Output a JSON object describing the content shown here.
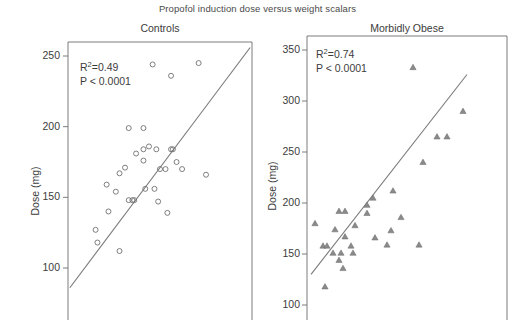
{
  "figure": {
    "title": "Propofol induction dose versus weight scalars",
    "background": "#ffffff",
    "ink_color": "#6e6e6e",
    "text_color": "#3c3c3c"
  },
  "panels": {
    "left": {
      "title": "Controls",
      "r2_prefix": "R",
      "r2_sup": "2",
      "r2_value": "=0.49",
      "pvalue": "P < 0.0001",
      "ylabel": "Dose (mg)",
      "yticks": [
        "100",
        "150",
        "200",
        "250"
      ]
    },
    "right": {
      "title": "Morbidly Obese",
      "r2_prefix": "R",
      "r2_sup": "2",
      "r2_value": "=0.74",
      "pvalue": "P < 0.0001",
      "ylabel": "Dose (mg)",
      "yticks": [
        "100",
        "150",
        "200",
        "250",
        "300",
        "350"
      ]
    }
  },
  "chart_data": [
    {
      "type": "scatter",
      "title": "Controls",
      "xlabel": "",
      "ylabel": "Dose (mg)",
      "ylim": [
        78,
        262
      ],
      "xlim": [
        0,
        1
      ],
      "yticks": [
        100,
        150,
        200,
        250
      ],
      "grid": false,
      "legend": "none",
      "marker": "open-circle",
      "r_squared": 0.49,
      "p_value": "< 0.0001",
      "annotations": [
        "R2 = 0.49",
        "P < 0.0001"
      ],
      "points": [
        {
          "x": 0.46,
          "y": 244
        },
        {
          "x": 0.71,
          "y": 245
        },
        {
          "x": 0.56,
          "y": 236
        },
        {
          "x": 0.33,
          "y": 199
        },
        {
          "x": 0.41,
          "y": 199
        },
        {
          "x": 0.41,
          "y": 184
        },
        {
          "x": 0.48,
          "y": 184
        },
        {
          "x": 0.56,
          "y": 184
        },
        {
          "x": 0.57,
          "y": 184
        },
        {
          "x": 0.41,
          "y": 176
        },
        {
          "x": 0.59,
          "y": 175
        },
        {
          "x": 0.28,
          "y": 167
        },
        {
          "x": 0.75,
          "y": 166
        },
        {
          "x": 0.37,
          "y": 181
        },
        {
          "x": 0.44,
          "y": 186
        },
        {
          "x": 0.31,
          "y": 171
        },
        {
          "x": 0.5,
          "y": 170
        },
        {
          "x": 0.53,
          "y": 170
        },
        {
          "x": 0.62,
          "y": 170
        },
        {
          "x": 0.21,
          "y": 159
        },
        {
          "x": 0.26,
          "y": 154
        },
        {
          "x": 0.42,
          "y": 156
        },
        {
          "x": 0.47,
          "y": 156
        },
        {
          "x": 0.33,
          "y": 148
        },
        {
          "x": 0.35,
          "y": 148
        },
        {
          "x": 0.36,
          "y": 148
        },
        {
          "x": 0.49,
          "y": 147
        },
        {
          "x": 0.54,
          "y": 139
        },
        {
          "x": 0.22,
          "y": 140
        },
        {
          "x": 0.15,
          "y": 127
        },
        {
          "x": 0.16,
          "y": 118
        },
        {
          "x": 0.28,
          "y": 112
        }
      ],
      "fit_line": {
        "x0": 0.01,
        "y0": 86,
        "x1": 0.99,
        "y1": 256
      }
    },
    {
      "type": "scatter",
      "title": "Morbidly Obese",
      "xlabel": "",
      "ylabel": "Dose (mg)",
      "ylim": [
        88,
        360
      ],
      "xlim": [
        0,
        1
      ],
      "yticks": [
        100,
        150,
        200,
        250,
        300,
        350
      ],
      "grid": false,
      "legend": "none",
      "marker": "filled-triangle",
      "r_squared": 0.74,
      "p_value": "< 0.0001",
      "annotations": [
        "R2 = 0.74",
        "P < 0.0001"
      ],
      "points": [
        {
          "x": 0.53,
          "y": 333
        },
        {
          "x": 0.78,
          "y": 290
        },
        {
          "x": 0.65,
          "y": 265
        },
        {
          "x": 0.7,
          "y": 265
        },
        {
          "x": 0.58,
          "y": 240
        },
        {
          "x": 0.43,
          "y": 212
        },
        {
          "x": 0.33,
          "y": 205
        },
        {
          "x": 0.3,
          "y": 198
        },
        {
          "x": 0.16,
          "y": 192
        },
        {
          "x": 0.19,
          "y": 192
        },
        {
          "x": 0.3,
          "y": 190
        },
        {
          "x": 0.47,
          "y": 186
        },
        {
          "x": 0.04,
          "y": 180
        },
        {
          "x": 0.24,
          "y": 178
        },
        {
          "x": 0.14,
          "y": 174
        },
        {
          "x": 0.42,
          "y": 173
        },
        {
          "x": 0.19,
          "y": 167
        },
        {
          "x": 0.34,
          "y": 166
        },
        {
          "x": 0.4,
          "y": 159
        },
        {
          "x": 0.56,
          "y": 159
        },
        {
          "x": 0.08,
          "y": 158
        },
        {
          "x": 0.1,
          "y": 158
        },
        {
          "x": 0.22,
          "y": 158
        },
        {
          "x": 0.13,
          "y": 151
        },
        {
          "x": 0.17,
          "y": 151
        },
        {
          "x": 0.23,
          "y": 151
        },
        {
          "x": 0.16,
          "y": 144
        },
        {
          "x": 0.18,
          "y": 136
        },
        {
          "x": 0.09,
          "y": 118
        }
      ],
      "fit_line": {
        "x0": 0.02,
        "y0": 130,
        "x1": 0.8,
        "y1": 326
      }
    }
  ]
}
